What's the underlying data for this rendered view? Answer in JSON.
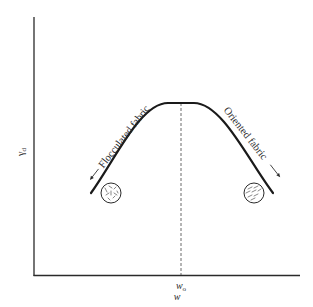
{
  "diagram": {
    "type": "compaction-curve",
    "axes": {
      "y_label": "γ",
      "y_label_sub": "d",
      "x_label": "w",
      "x_tick_label": "w",
      "x_tick_label_sub": "o"
    },
    "curve": {
      "description": "Dry unit weight vs. moisture content; peak at optimum moisture content",
      "peak_at": "wo"
    },
    "annotations": {
      "left": "Flocculated fabric",
      "right": "Oriented fabric"
    },
    "icons": {
      "left": "flocculated-particles-circle",
      "right": "oriented-particles-circle"
    },
    "colors": {
      "line": "#1a1a1a",
      "axis": "#2a2a2a",
      "background": "#ffffff"
    }
  }
}
